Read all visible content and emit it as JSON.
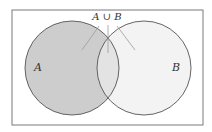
{
  "diagram": {
    "type": "venn",
    "frame": {
      "x": 12,
      "y": 10,
      "width": 191,
      "height": 115,
      "stroke": "#7a7a7a"
    },
    "sets": [
      {
        "id": "A",
        "label": "A",
        "cx": 72,
        "cy": 68,
        "r": 47,
        "fill": "#cdcdcd"
      },
      {
        "id": "B",
        "label": "B",
        "cx": 144,
        "cy": 68,
        "r": 47,
        "fill": "#f3f3f3"
      }
    ],
    "intersection_fill": "#e3e3e3",
    "stroke": "#555555",
    "annotation": {
      "label": "A ∪ B",
      "x": 107,
      "y": 20
    },
    "leader_color": "#9a9a9a"
  }
}
